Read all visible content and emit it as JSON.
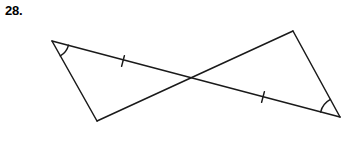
{
  "exercise": {
    "number_label": "28."
  },
  "figure": {
    "type": "geometry-diagram",
    "stroke_color": "#1a1a1a",
    "background_color": "#ffffff",
    "stroke_width": 1.5,
    "vertices": {
      "left_apex": {
        "x": 52,
        "y": 41
      },
      "bottom_left": {
        "x": 97,
        "y": 121
      },
      "top_right": {
        "x": 293,
        "y": 31
      },
      "right_apex": {
        "x": 340,
        "y": 117
      },
      "intersection": {
        "x": 194,
        "y": 80
      }
    },
    "segments": [
      {
        "name": "left-apex-to-bottom-left",
        "x1": 52,
        "y1": 41,
        "x2": 97,
        "y2": 121
      },
      {
        "name": "left-apex-to-right-apex",
        "x1": 52,
        "y1": 41,
        "x2": 340,
        "y2": 117
      },
      {
        "name": "bottom-left-to-top-right",
        "x1": 97,
        "y1": 121,
        "x2": 293,
        "y2": 31
      },
      {
        "name": "top-right-to-right-apex",
        "x1": 293,
        "y1": 31,
        "x2": 340,
        "y2": 117
      }
    ],
    "tick_marks": [
      {
        "name": "upper-segment-tick",
        "x": 123,
        "y": 61,
        "angle": 14.8
      },
      {
        "name": "lower-segment-tick",
        "x": 263,
        "y": 97,
        "angle": 14.8
      }
    ],
    "angle_arcs": [
      {
        "name": "left-vertex-angle-arc",
        "vertex_x": 52,
        "vertex_y": 41,
        "radius": 17
      },
      {
        "name": "right-vertex-angle-arc",
        "vertex_x": 340,
        "vertex_y": 117,
        "radius": 20
      }
    ]
  }
}
